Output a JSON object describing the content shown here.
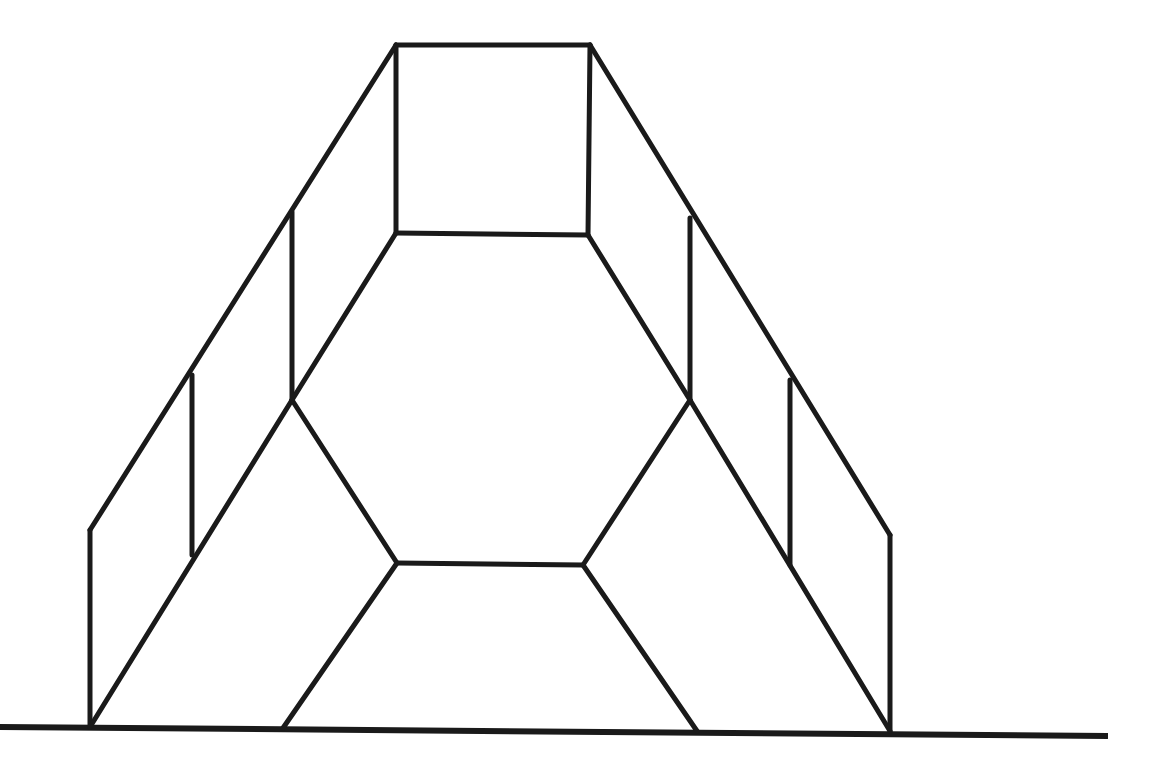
{
  "figure": {
    "type": "line-drawing",
    "stroke_color": "#1a1a1a",
    "background": "#ffffff",
    "ground_line": {
      "x1": 0,
      "y1": 727,
      "x2": 1108,
      "y2": 736
    },
    "segments": [
      [
        396,
        45,
        590,
        45
      ],
      [
        396,
        45,
        396,
        233
      ],
      [
        590,
        45,
        588,
        235
      ],
      [
        396,
        233,
        588,
        235
      ],
      [
        396,
        45,
        90,
        530
      ],
      [
        590,
        45,
        890,
        535
      ],
      [
        396,
        233,
        292,
        400
      ],
      [
        588,
        235,
        690,
        400
      ],
      [
        292,
        212,
        292,
        400
      ],
      [
        690,
        218,
        690,
        400
      ],
      [
        192,
        375,
        192,
        555
      ],
      [
        790,
        380,
        790,
        565
      ],
      [
        90,
        530,
        90,
        727
      ],
      [
        890,
        535,
        890,
        731
      ],
      [
        292,
        400,
        397,
        563
      ],
      [
        690,
        400,
        583,
        565
      ],
      [
        397,
        563,
        583,
        565
      ],
      [
        292,
        400,
        90,
        727
      ],
      [
        690,
        400,
        890,
        731
      ],
      [
        397,
        563,
        283,
        728
      ],
      [
        583,
        565,
        697,
        731
      ]
    ]
  }
}
